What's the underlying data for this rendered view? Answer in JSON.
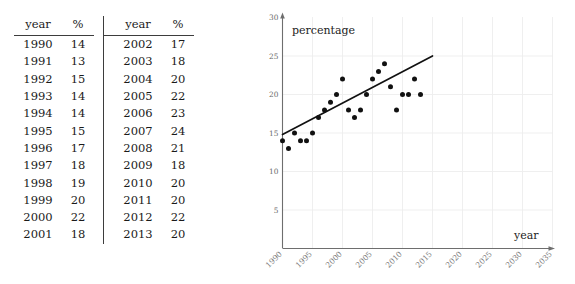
{
  "table": {
    "headers": [
      "year",
      "%",
      "year",
      "%"
    ],
    "left_rows": [
      [
        "1990",
        "14"
      ],
      [
        "1991",
        "13"
      ],
      [
        "1992",
        "15"
      ],
      [
        "1993",
        "14"
      ],
      [
        "1994",
        "14"
      ],
      [
        "1995",
        "15"
      ],
      [
        "1996",
        "17"
      ],
      [
        "1997",
        "18"
      ],
      [
        "1998",
        "19"
      ],
      [
        "1999",
        "20"
      ],
      [
        "2000",
        "22"
      ],
      [
        "2001",
        "18"
      ]
    ],
    "right_rows": [
      [
        "2002",
        "17"
      ],
      [
        "2003",
        "18"
      ],
      [
        "2004",
        "20"
      ],
      [
        "2005",
        "22"
      ],
      [
        "2006",
        "23"
      ],
      [
        "2007",
        "24"
      ],
      [
        "2008",
        "21"
      ],
      [
        "2009",
        "18"
      ],
      [
        "2010",
        "20"
      ],
      [
        "2011",
        "20"
      ],
      [
        "2012",
        "22"
      ],
      [
        "2013",
        "20"
      ]
    ]
  },
  "chart_data": {
    "type": "scatter",
    "title": "",
    "xlabel": "year",
    "ylabel": "percentage",
    "xlim": [
      1990,
      2035
    ],
    "ylim": [
      0,
      30
    ],
    "xticks": [
      1990,
      1995,
      2000,
      2005,
      2010,
      2015,
      2020,
      2025,
      2030,
      2035
    ],
    "yticks": [
      5,
      10,
      15,
      20,
      25,
      30
    ],
    "grid": true,
    "legend": "none",
    "x": [
      1990,
      1991,
      1992,
      1993,
      1994,
      1995,
      1996,
      1997,
      1998,
      1999,
      2000,
      2001,
      2002,
      2003,
      2004,
      2005,
      2006,
      2007,
      2008,
      2009,
      2010,
      2011,
      2012,
      2013
    ],
    "y": [
      14,
      13,
      15,
      14,
      14,
      15,
      17,
      18,
      19,
      20,
      22,
      18,
      17,
      18,
      20,
      22,
      23,
      24,
      21,
      18,
      20,
      20,
      22,
      20
    ],
    "series": [
      {
        "name": "percentage",
        "values": [
          14,
          13,
          15,
          14,
          14,
          15,
          17,
          18,
          19,
          20,
          22,
          18,
          17,
          18,
          20,
          22,
          23,
          24,
          21,
          18,
          20,
          20,
          22,
          20
        ]
      }
    ],
    "trendline": {
      "type": "line",
      "x_start": 1990,
      "y_start": 14.8,
      "x_end": 2015,
      "y_end": 25.0
    },
    "marker_color": "#111111",
    "trendline_color": "#111111",
    "grid_color": "#ededed",
    "axis_color": "#6e6e6e"
  }
}
